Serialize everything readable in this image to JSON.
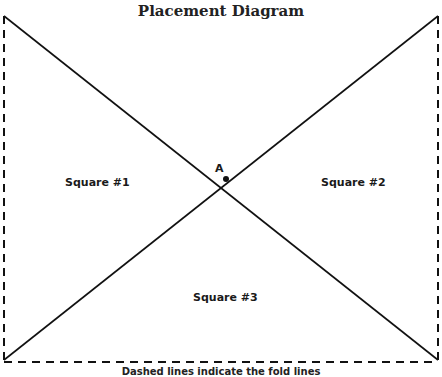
{
  "title": "Placement Diagram",
  "regions": [
    {
      "label": "Square #1"
    },
    {
      "label": "Square #2"
    },
    {
      "label": "Square #3"
    }
  ],
  "point": {
    "label": "A"
  },
  "caption": "Dashed lines indicate the fold lines",
  "colors": {
    "line": "#111111",
    "background": "#ffffff"
  }
}
